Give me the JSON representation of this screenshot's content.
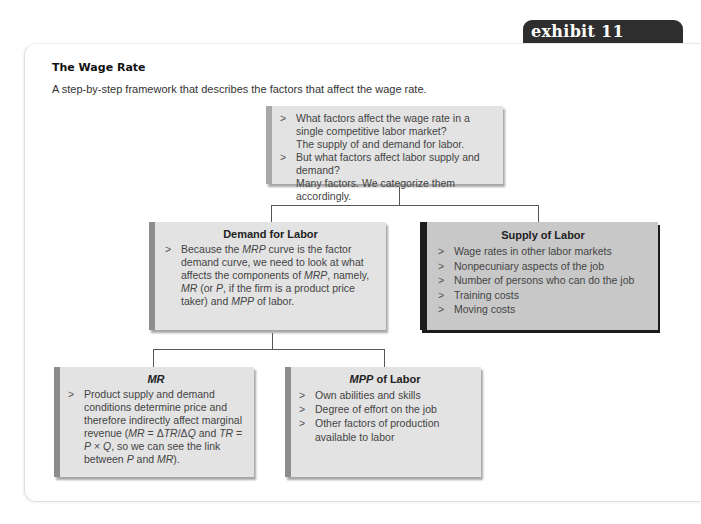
{
  "exhibit": {
    "label": "exhibit 11"
  },
  "header": {
    "title": "The Wage Rate",
    "subtitle": "A step-by-step framework that describes the factors that affect the wage rate."
  },
  "top_box": {
    "items": [
      {
        "text": "What factors affect the wage rate in a single competitive labor market?",
        "answer": "The supply of and demand for labor."
      },
      {
        "text": "But what factors affect labor supply and demand?",
        "answer": "Many factors. We categorize them accordingly."
      }
    ]
  },
  "demand_box": {
    "heading": "Demand for Labor",
    "items": [
      "Because the MRP curve is the factor demand curve, we need to look at what affects the components of MRP, namely, MR (or P, if the firm is a product price taker) and MPP of labor."
    ]
  },
  "supply_box": {
    "heading": "Supply of Labor",
    "items": [
      "Wage rates in other labor markets",
      "Nonpecuniary aspects of the job",
      "Number of persons who can do the job",
      "Training costs",
      "Moving costs"
    ]
  },
  "mr_box": {
    "heading": "MR",
    "items": [
      "Product supply and demand conditions determine price and therefore indirectly affect marginal revenue (MR = ΔTR/ΔQ and TR = P × Q, so we can see the link between P and MR)."
    ]
  },
  "mpp_box": {
    "heading_italic": "MPP",
    "heading_rest": " of Labor",
    "items": [
      "Own abilities and skills",
      "Degree of effort on the job",
      "Other factors of production available to labor"
    ]
  },
  "colors": {
    "tab_bg": "#2e2e2e",
    "box_bg": "#e3e3e3",
    "supply_bg": "#c8c8c8",
    "dark_bar": "#1c1c1c"
  }
}
